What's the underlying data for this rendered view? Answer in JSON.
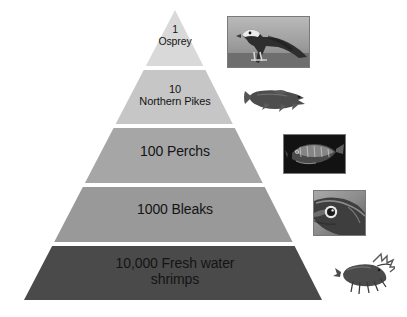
{
  "figure": {
    "type": "pyramid-diagram",
    "background_color": "#ffffff",
    "text_color": "#141414"
  },
  "pyramid": {
    "apex": {
      "x": 175,
      "y": 10
    },
    "base_left": {
      "x": 24,
      "y": 300
    },
    "base_right": {
      "x": 322,
      "y": 300
    },
    "divider_color": "#ffffff",
    "tiers": [
      {
        "index": 0,
        "count": "1",
        "organism": "Osprey",
        "label": "1\nOsprey",
        "fill": "#d9d9d9",
        "top_y": 10,
        "bottom_y": 66,
        "trophic_level": 5
      },
      {
        "index": 1,
        "count": "10",
        "organism": "Northern Pikes",
        "label": "10\nNorthern Pikes",
        "fill": "#c6c6c6",
        "top_y": 70,
        "bottom_y": 124,
        "trophic_level": 4
      },
      {
        "index": 2,
        "count": "100",
        "organism": "Perchs",
        "label": "100 Perchs",
        "fill": "#a6a6a6",
        "top_y": 128,
        "bottom_y": 183,
        "trophic_level": 3
      },
      {
        "index": 3,
        "count": "1000",
        "organism": "Bleaks",
        "label": "1000 Bleaks",
        "fill": "#999999",
        "top_y": 187,
        "bottom_y": 242,
        "trophic_level": 2
      },
      {
        "index": 4,
        "count": "10,000",
        "organism": "Fresh water shrimps",
        "label": "10,000 Fresh water\nshrimps",
        "fill": "#4a4a4a",
        "top_y": 246,
        "bottom_y": 300,
        "trophic_level": 1
      }
    ]
  },
  "photos": [
    {
      "name": "osprey-photo",
      "alt": "Osprey bird perched",
      "framed": true
    },
    {
      "name": "pike-photo",
      "alt": "Northern pike fish",
      "framed": false
    },
    {
      "name": "perch-photo",
      "alt": "Perch fish",
      "framed": true
    },
    {
      "name": "bleak-photo",
      "alt": "Bleak fish head close-up",
      "framed": true
    },
    {
      "name": "shrimp-photo",
      "alt": "Fresh water shrimp",
      "framed": false
    }
  ],
  "chart_data": {
    "type": "bar",
    "xlabel": "",
    "ylabel": "Trophic level",
    "categories": [
      "Fresh water shrimps",
      "Bleaks",
      "Perchs",
      "Northern Pikes",
      "Osprey"
    ],
    "values": [
      10000,
      1000,
      100,
      10,
      1
    ],
    "value_labels": [
      "10,000",
      "1000",
      "100",
      "10",
      "1"
    ],
    "ylim": [
      1,
      10000
    ],
    "grid": false,
    "legend": "none"
  }
}
